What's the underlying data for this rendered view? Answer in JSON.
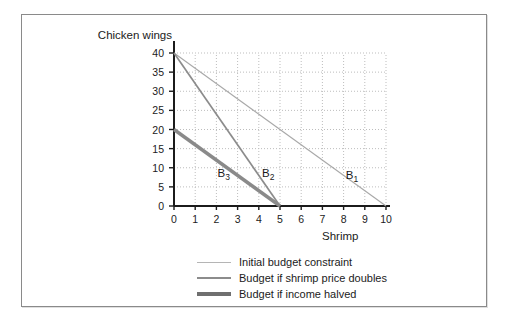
{
  "figure": {
    "background_color": "#ffffff",
    "border_color": "#8a8a8a"
  },
  "chart_data": {
    "type": "line",
    "title": "",
    "subtitle": "",
    "xlabel": "Shrimp",
    "ylabel": "Chicken wings",
    "xlim": [
      0,
      10
    ],
    "ylim": [
      0,
      40
    ],
    "xticks": [
      0,
      1,
      2,
      3,
      4,
      5,
      6,
      7,
      8,
      9,
      10
    ],
    "yticks": [
      0,
      5,
      10,
      15,
      20,
      25,
      30,
      35,
      40
    ],
    "xtick_labels": [
      "0",
      "1",
      "2",
      "3",
      "4",
      "5",
      "6",
      "7",
      "8",
      "9",
      "10"
    ],
    "ytick_labels": [
      "0",
      "5",
      "10",
      "15",
      "20",
      "25",
      "30",
      "35",
      "40"
    ],
    "grid": true,
    "grid_style": "dotted",
    "grid_color": "#bdbdbd",
    "legend_position": "below",
    "series": [
      {
        "name": "Initial budget constraint",
        "label": "B1",
        "annotation": "B",
        "annotation_sub": "1",
        "x": [
          0,
          10
        ],
        "values": [
          40,
          0
        ],
        "color": "#a8a8a8",
        "width": 1.1,
        "annotation_x": 8.1,
        "annotation_y": 7.6
      },
      {
        "name": "Budget if shrimp price doubles",
        "label": "B2",
        "annotation": "B",
        "annotation_sub": "2",
        "x": [
          0,
          5
        ],
        "values": [
          40,
          0
        ],
        "color": "#8c8c8c",
        "width": 1.7,
        "annotation_x": 4.15,
        "annotation_y": 8.0
      },
      {
        "name": "Budget if income halved",
        "label": "B3",
        "annotation": "B",
        "annotation_sub": "3",
        "x": [
          0,
          5
        ],
        "values": [
          20,
          0
        ],
        "color": "#8a8a8a",
        "width": 3.4,
        "annotation_x": 2.05,
        "annotation_y": 8.0
      }
    ],
    "annotations": [
      {
        "text": "B",
        "sub": "1",
        "x": 8.1,
        "y": 7.6
      },
      {
        "text": "B",
        "sub": "2",
        "x": 4.15,
        "y": 8.0
      },
      {
        "text": "B",
        "sub": "3",
        "x": 2.05,
        "y": 8.0
      }
    ]
  },
  "legend": {
    "items": [
      {
        "label": "Initial budget constraint",
        "color": "#b5b5b5",
        "thickness": 1
      },
      {
        "label": "Budget if shrimp price doubles",
        "color": "#8c8c8c",
        "thickness": 2
      },
      {
        "label": "Budget if income halved",
        "color": "#6f6f6f",
        "thickness": 4
      }
    ]
  }
}
